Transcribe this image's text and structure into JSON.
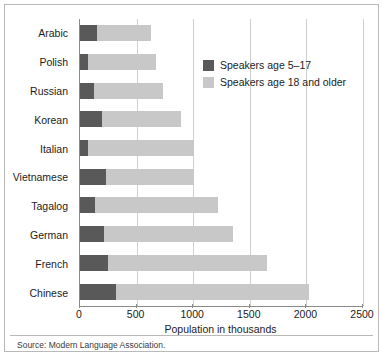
{
  "figure": {
    "source_note": "Source: Modern Language Association."
  },
  "legend": {
    "position": "inside-top-right",
    "items": [
      {
        "label": "Speakers age 5–17",
        "color": "#595959",
        "key": "young"
      },
      {
        "label": "Speakers age 18 and older",
        "color": "#c8c8c8",
        "key": "adult"
      }
    ]
  },
  "chart_data": {
    "type": "bar",
    "orientation": "horizontal",
    "stacked": true,
    "title": "",
    "xlabel": "Population in thousands",
    "ylabel": "",
    "xlim": [
      0,
      2500
    ],
    "xticks": [
      0,
      500,
      1000,
      1500,
      2000,
      2500
    ],
    "xticklabels": [
      "0",
      "500",
      "1000",
      "1500",
      "2000",
      "2500"
    ],
    "grid": "vertical",
    "categories": [
      "Arabic",
      "Polish",
      "Russian",
      "Korean",
      "Italian",
      "Vietnamese",
      "Tagalog",
      "German",
      "French",
      "Chinese"
    ],
    "series": [
      {
        "name": "Speakers age 5–17",
        "color": "#595959",
        "values": [
          150,
          70,
          125,
          195,
          70,
          230,
          130,
          210,
          250,
          320
        ]
      },
      {
        "name": "Speakers age 18 and older",
        "color": "#c8c8c8",
        "values": [
          475,
          600,
          610,
          700,
          940,
          780,
          1090,
          1140,
          1400,
          1700
        ]
      }
    ],
    "totals": [
      625,
      670,
      735,
      895,
      1010,
      1010,
      1220,
      1350,
      1650,
      2020
    ]
  }
}
